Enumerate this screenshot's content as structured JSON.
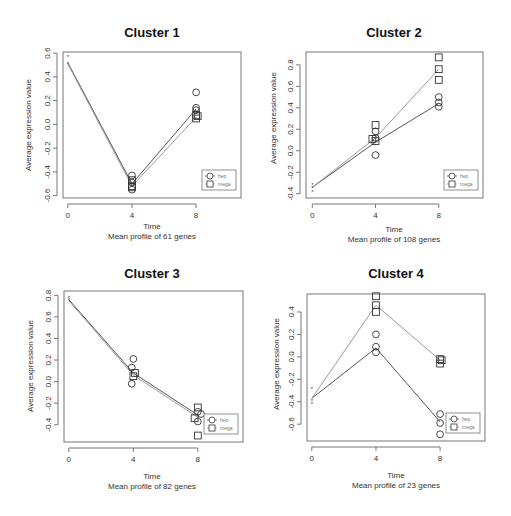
{
  "chart_data": [
    {
      "type": "line",
      "title": "Cluster 1",
      "xlabel": "Time",
      "subtitle": "Mean profile of  61  genes",
      "ylabel": "Average expression value",
      "x_ticks": [
        0,
        4,
        8
      ],
      "y_ticks": [
        -0.6,
        -0.4,
        -0.2,
        0.0,
        0.2,
        0.4,
        0.6
      ],
      "y_tick_labels": [
        "-0.6",
        "-0.4",
        "-0.2",
        "0.0",
        "0.2",
        "0.4",
        "0.6"
      ],
      "xlim": [
        -0.3,
        10.8
      ],
      "ylim": [
        -0.62,
        0.61
      ],
      "legend": [
        {
          "label": "hep",
          "marker": "circle"
        },
        {
          "label": "mega",
          "marker": "square"
        }
      ],
      "series": [
        {
          "name": "hep",
          "color": "#555555",
          "x": [
            0,
            4,
            8
          ],
          "y": [
            0.52,
            -0.5,
            0.13
          ]
        },
        {
          "name": "mega",
          "color": "#999999",
          "x": [
            0,
            4,
            8
          ],
          "y": [
            0.51,
            -0.52,
            0.06
          ]
        }
      ],
      "points": {
        "hep": [
          [
            0,
            0.57
          ],
          [
            4,
            -0.43
          ],
          [
            4,
            -0.49
          ],
          [
            4,
            -0.55
          ],
          [
            8,
            0.27
          ],
          [
            8,
            0.14
          ],
          [
            8,
            0.12
          ]
        ],
        "mega": [
          [
            0,
            0.51
          ],
          [
            4,
            -0.47
          ],
          [
            4,
            -0.52
          ],
          [
            4,
            -0.53
          ],
          [
            8,
            0.08
          ],
          [
            8,
            0.05
          ],
          [
            8.1,
            0.07
          ]
        ]
      }
    },
    {
      "type": "line",
      "title": "Cluster 2",
      "xlabel": "Time",
      "subtitle": "Mean profile of  108  genes",
      "ylabel": "Average expression value",
      "x_ticks": [
        0,
        4,
        8
      ],
      "y_ticks": [
        -0.4,
        -0.2,
        0.0,
        0.2,
        0.4,
        0.6,
        0.8
      ],
      "y_tick_labels": [
        "-0.4",
        "-0.2",
        "0.0",
        "0.2",
        "0.4",
        "0.6",
        "0.8"
      ],
      "xlim": [
        -0.4,
        10.8
      ],
      "ylim": [
        -0.44,
        0.92
      ],
      "legend": [
        {
          "label": "hep",
          "marker": "circle"
        },
        {
          "label": "mega",
          "marker": "square"
        }
      ],
      "series": [
        {
          "name": "hep",
          "color": "#555555",
          "x": [
            0,
            4,
            8
          ],
          "y": [
            -0.34,
            0.08,
            0.44
          ]
        },
        {
          "name": "mega",
          "color": "#999999",
          "x": [
            0,
            4,
            8
          ],
          "y": [
            -0.34,
            0.12,
            0.76
          ]
        }
      ],
      "points": {
        "hep": [
          [
            0,
            -0.31
          ],
          [
            0,
            -0.38
          ],
          [
            4,
            0.18
          ],
          [
            4,
            0.12
          ],
          [
            4,
            -0.04
          ],
          [
            8,
            0.5
          ],
          [
            8,
            0.45
          ],
          [
            8,
            0.41
          ]
        ],
        "mega": [
          [
            0,
            -0.34
          ],
          [
            4,
            0.24
          ],
          [
            3.8,
            0.11
          ],
          [
            4,
            0.09
          ],
          [
            8,
            0.87
          ],
          [
            8,
            0.76
          ],
          [
            8,
            0.66
          ]
        ]
      }
    },
    {
      "type": "line",
      "title": "Cluster 3",
      "xlabel": "Time",
      "subtitle": "Mean profile of  82  genes",
      "ylabel": "Average expression value",
      "x_ticks": [
        0,
        4,
        8
      ],
      "y_ticks": [
        -0.4,
        -0.2,
        0.0,
        0.2,
        0.4,
        0.6,
        0.8
      ],
      "y_tick_labels": [
        "-0.4",
        "-0.2",
        "0.0",
        "0.2",
        "0.4",
        "0.6",
        "0.8"
      ],
      "xlim": [
        -0.3,
        10.8
      ],
      "ylim": [
        -0.56,
        0.84
      ],
      "legend": [
        {
          "label": "hep",
          "marker": "circle"
        },
        {
          "label": "mega",
          "marker": "square"
        }
      ],
      "series": [
        {
          "name": "hep",
          "color": "#555555",
          "x": [
            0,
            4,
            8
          ],
          "y": [
            0.76,
            0.08,
            -0.31
          ]
        },
        {
          "name": "mega",
          "color": "#999999",
          "x": [
            0,
            4,
            8
          ],
          "y": [
            0.75,
            0.06,
            -0.33
          ]
        }
      ],
      "points": {
        "hep": [
          [
            0,
            0.78
          ],
          [
            4.0,
            0.21
          ],
          [
            3.9,
            0.13
          ],
          [
            3.9,
            -0.02
          ],
          [
            8.2,
            -0.3
          ],
          [
            8,
            -0.37
          ],
          [
            8,
            -0.28
          ]
        ],
        "mega": [
          [
            0,
            0.76
          ],
          [
            4.1,
            0.08
          ],
          [
            4,
            0.05
          ],
          [
            8,
            -0.24
          ],
          [
            7.8,
            -0.34
          ],
          [
            8,
            -0.5
          ]
        ]
      }
    },
    {
      "type": "line",
      "title": "Cluster 4",
      "xlabel": "Time",
      "subtitle": "Mean profile of  23  genes",
      "ylabel": "Average expression value",
      "x_ticks": [
        0,
        4,
        8
      ],
      "y_ticks": [
        -0.6,
        -0.4,
        -0.2,
        0.0,
        0.2,
        0.4
      ],
      "y_tick_labels": [
        "-0.6",
        "-0.4",
        "-0.2",
        "0.0",
        "0.2",
        "0.4"
      ],
      "xlim": [
        -0.3,
        10.8
      ],
      "ylim": [
        -0.75,
        0.56
      ],
      "legend": [
        {
          "label": "hep",
          "marker": "circle"
        },
        {
          "label": "mega",
          "marker": "square"
        }
      ],
      "series": [
        {
          "name": "hep",
          "color": "#555555",
          "x": [
            0,
            4,
            8
          ],
          "y": [
            -0.37,
            0.08,
            -0.58
          ]
        },
        {
          "name": "mega",
          "color": "#999999",
          "x": [
            0,
            4,
            8
          ],
          "y": [
            -0.37,
            0.46,
            -0.03
          ]
        }
      ],
      "points": {
        "hep": [
          [
            0,
            -0.28
          ],
          [
            0,
            -0.39
          ],
          [
            4,
            0.2
          ],
          [
            4,
            0.09
          ],
          [
            4,
            0.04
          ],
          [
            8,
            -0.51
          ],
          [
            8,
            -0.59
          ],
          [
            8,
            -0.69
          ]
        ],
        "mega": [
          [
            0,
            -0.42
          ],
          [
            4,
            0.54
          ],
          [
            4,
            0.46
          ],
          [
            4,
            0.4
          ],
          [
            8,
            -0.02
          ],
          [
            8.1,
            -0.03
          ],
          [
            8,
            -0.06
          ]
        ]
      }
    }
  ],
  "panels": [
    {
      "title": "Cluster 1",
      "xlabel": "Time",
      "subtitle": "Mean profile of  61  genes",
      "ylabel": "Average expression value",
      "legend_hep": "hep",
      "legend_mega": "mega"
    },
    {
      "title": "Cluster 2",
      "xlabel": "Time",
      "subtitle": "Mean profile of  108  genes",
      "ylabel": "Average expression value",
      "legend_hep": "hep",
      "legend_mega": "mega"
    },
    {
      "title": "Cluster 3",
      "xlabel": "Time",
      "subtitle": "Mean profile of  82  genes",
      "ylabel": "Average expression value",
      "legend_hep": "hep",
      "legend_mega": "mega"
    },
    {
      "title": "Cluster 4",
      "xlabel": "Time",
      "subtitle": "Mean profile of  23  genes",
      "ylabel": "Average expression value",
      "legend_hep": "hep",
      "legend_mega": "mega"
    }
  ],
  "layout": {
    "boxes": [
      {
        "x0": 63,
        "y0": 52,
        "x1": 241,
        "y1": 198
      },
      {
        "x0": 306,
        "y0": 52,
        "x1": 483,
        "y1": 198
      },
      {
        "x0": 64,
        "y0": 291,
        "x1": 243,
        "y1": 442
      },
      {
        "x0": 307,
        "y0": 294,
        "x1": 485,
        "y1": 441
      }
    ],
    "colors": {
      "hep_line": "#555555",
      "mega_line": "#9a9a9a",
      "axis": "#777777",
      "marker": "#333333"
    }
  }
}
